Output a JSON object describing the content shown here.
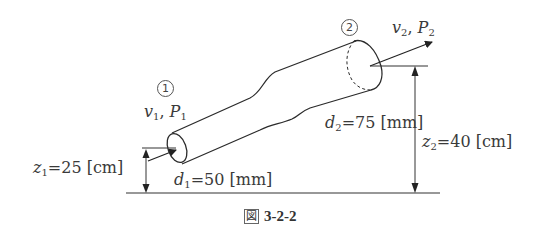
{
  "diagram": {
    "section1": {
      "marker": "1",
      "velocity_symbol": "v",
      "velocity_sub": "1",
      "pressure_symbol": "P",
      "pressure_sub": "1"
    },
    "section2": {
      "marker": "2",
      "velocity_symbol": "v",
      "velocity_sub": "2",
      "pressure_symbol": "P",
      "pressure_sub": "2"
    },
    "dimensions": {
      "z1": {
        "symbol": "z",
        "sub": "1",
        "value": "=25 [cm]"
      },
      "z2": {
        "symbol": "z",
        "sub": "2",
        "value": "=40 [cm]"
      },
      "d1": {
        "symbol": "d",
        "sub": "1",
        "value": "=50 [mm]"
      },
      "d2": {
        "symbol": "d",
        "sub": "2",
        "value": "=75 [mm]"
      }
    },
    "separator": ",",
    "caption": {
      "prefix": "図",
      "number": "3-2-2"
    },
    "colors": {
      "line": "#2b2b2b",
      "text": "#3a3a3a"
    }
  }
}
